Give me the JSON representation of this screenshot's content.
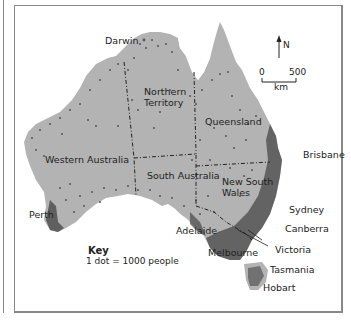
{
  "map": {
    "subject": "Population distribution of Australia",
    "land_color": "#b3b3b3",
    "dot_color": "#555555",
    "border_style": "dash-dot",
    "labels": {
      "darwin": "Darwin",
      "northern_territory_1": "Northern",
      "northern_territory_2": "Territory",
      "queensland": "Queensland",
      "western_australia": "Western Australia",
      "south_australia": "South Australia",
      "nsw_1": "New South",
      "nsw_2": "Wales",
      "brisbane": "Brisbane",
      "sydney": "Sydney",
      "canberra": "Canberra",
      "perth": "Perth",
      "adelaide": "Adelaide",
      "melbourne": "Melbourne",
      "victoria": "Victoria",
      "tasmania": "Tasmania",
      "hobart": "Hobart"
    },
    "north_arrow": "N",
    "scale": {
      "start": "0",
      "end": "500",
      "unit": "km"
    },
    "key": {
      "title": "Key",
      "text": "1 dot = 1000 people"
    }
  }
}
